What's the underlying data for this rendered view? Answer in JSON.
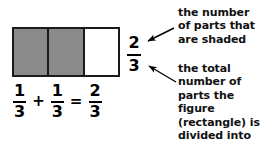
{
  "figure": {
    "name": "fraction-rectangle",
    "total_parts": 3,
    "shaded_parts": 2,
    "parts": [
      {
        "index": 1,
        "state": "shaded"
      },
      {
        "index": 2,
        "state": "shaded"
      },
      {
        "index": 3,
        "state": "unshaded"
      }
    ],
    "shaded_color": "#8a8a8a",
    "unshaded_color": "#ffffff",
    "border_color": "#1a1a1a"
  },
  "equation": {
    "term1": {
      "numerator": "1",
      "denominator": "3"
    },
    "operator_plus": "+",
    "term2": {
      "numerator": "1",
      "denominator": "3"
    },
    "operator_equals": "=",
    "result": {
      "numerator": "2",
      "denominator": "3"
    },
    "full_text": "1/3 + 1/3 = 2/3"
  },
  "result_fraction": {
    "numerator": "2",
    "denominator": "3"
  },
  "callouts": {
    "numerator_note": {
      "lines": [
        "the number",
        "of parts that",
        "are shaded"
      ],
      "text": "the number\nof parts that\nare shaded"
    },
    "denominator_note": {
      "lines": [
        "the total",
        "number of",
        "parts the",
        "figure",
        "(rectangle) is",
        "divided into"
      ],
      "text": "the total\nnumber of\nparts the\nfigure\n(rectangle) is\ndivided into"
    }
  },
  "colors": {
    "background": "#ffffff",
    "ink": "#000000",
    "gray_fill": "#8a8a8a"
  }
}
